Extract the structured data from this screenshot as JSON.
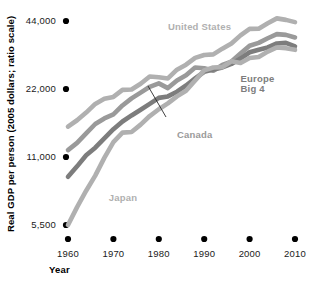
{
  "chart_data": {
    "type": "line",
    "title": "",
    "xlabel": "Year",
    "ylabel": "Real GDP per person (2005 dollars; ratio scale)",
    "scale": "log",
    "grid": false,
    "legend_position": "inline-annotations",
    "xlim": [
      1960,
      2011
    ],
    "ylim": [
      5500,
      48000
    ],
    "yticks": [
      5500,
      11000,
      22000,
      44000
    ],
    "ytick_labels": [
      "5,500",
      "11,000",
      "22,000",
      "44,000"
    ],
    "xticks": [
      1960,
      1970,
      1980,
      1990,
      2000,
      2010
    ],
    "xtick_labels": [
      "1960",
      "1970",
      "1980",
      "1990",
      "2000",
      "2010"
    ],
    "series": [
      {
        "name": "United States",
        "color": "#b0b0b0",
        "x": [
          1960,
          1962,
          1964,
          1966,
          1968,
          1970,
          1972,
          1974,
          1976,
          1978,
          1980,
          1982,
          1984,
          1986,
          1988,
          1990,
          1992,
          1994,
          1996,
          1998,
          2000,
          2002,
          2004,
          2006,
          2008,
          2010
        ],
        "values": [
          15000,
          16000,
          17300,
          18900,
          19900,
          20300,
          21800,
          21900,
          23200,
          25000,
          24800,
          24500,
          26800,
          28200,
          30200,
          31100,
          31300,
          33200,
          35000,
          38000,
          40600,
          40700,
          43000,
          45200,
          44500,
          43500
        ]
      },
      {
        "name": "Canada",
        "color": "#9a9a9a",
        "x": [
          1960,
          1962,
          1964,
          1966,
          1968,
          1970,
          1972,
          1974,
          1976,
          1978,
          1980,
          1982,
          1984,
          1986,
          1988,
          1990,
          1992,
          1994,
          1996,
          1998,
          2000,
          2002,
          2004,
          2006,
          2008,
          2010
        ],
        "values": [
          11800,
          12700,
          14000,
          15400,
          16300,
          17000,
          18600,
          20000,
          21200,
          22500,
          23300,
          22200,
          24000,
          25300,
          27400,
          27200,
          26500,
          28100,
          29100,
          31600,
          34200,
          35200,
          36900,
          38500,
          38200,
          37200
        ]
      },
      {
        "name": "Europe Big 4",
        "color": "#7d7d7d",
        "x": [
          1960,
          1962,
          1964,
          1966,
          1968,
          1970,
          1972,
          1974,
          1976,
          1978,
          1980,
          1982,
          1984,
          1986,
          1988,
          1990,
          1992,
          1994,
          1996,
          1998,
          2000,
          2002,
          2004,
          2006,
          2008,
          2010
        ],
        "values": [
          9000,
          10000,
          11200,
          12100,
          13300,
          14600,
          15800,
          16800,
          17800,
          18900,
          20100,
          20400,
          21400,
          22800,
          24500,
          26200,
          26800,
          27400,
          28400,
          30000,
          32000,
          32800,
          33600,
          35000,
          35200,
          34000
        ]
      },
      {
        "name": "Japan",
        "color": "#b0b0b0",
        "x": [
          1960,
          1962,
          1964,
          1966,
          1968,
          1970,
          1972,
          1974,
          1976,
          1978,
          1980,
          1982,
          1984,
          1986,
          1988,
          1990,
          1992,
          1994,
          1996,
          1998,
          2000,
          2002,
          2004,
          2006,
          2008,
          2010
        ],
        "values": [
          5500,
          6600,
          7800,
          9100,
          10900,
          12800,
          14100,
          14200,
          15300,
          16700,
          17900,
          19000,
          20400,
          21600,
          24000,
          26600,
          27400,
          27500,
          29200,
          28700,
          30200,
          30500,
          32200,
          33600,
          33300,
          32800
        ]
      }
    ],
    "annotations": [
      {
        "name": "United States",
        "text": "United States",
        "x": 1982,
        "y": 40000
      },
      {
        "name": "Europe Big 4",
        "text": "Europe",
        "x": 1998,
        "y": 23600
      },
      {
        "name": "Europe Big 4b",
        "text": "Big 4",
        "x": 1998,
        "y": 21300
      },
      {
        "name": "Canada",
        "text": "Canada",
        "x": 1984,
        "y": 13400
      },
      {
        "name": "Japan",
        "text": "Japan",
        "x": 1969,
        "y": 7000
      }
    ]
  }
}
